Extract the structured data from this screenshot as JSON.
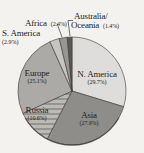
{
  "background": "#f3f2ef",
  "chart_data": {
    "type": "pie",
    "title": "",
    "legend_position": "none",
    "direction": "clockwise",
    "start_angle_deg": 0,
    "total": 100,
    "geometry": {
      "cx": 72,
      "cy": 91,
      "r": 54
    },
    "outline_color": "#3a3734",
    "slices": [
      {
        "name": "N. America",
        "value": 29.7,
        "pct_label": "(29.7%)",
        "color": "#dedddb",
        "label_placement": "inside"
      },
      {
        "name": "Asia",
        "value": 27.9,
        "pct_label": "(27.9%)",
        "color": "#8f8d8a",
        "label_placement": "inside"
      },
      {
        "name": "Russia",
        "value": 10.6,
        "pct_label": "(10.6%)",
        "color": "pattern:stripes",
        "label_placement": "inside"
      },
      {
        "name": "Europe",
        "value": 25.1,
        "pct_label": "(25.1%)",
        "color": "#abaaa7",
        "label_placement": "inside"
      },
      {
        "name": "S. America",
        "value": 2.9,
        "pct_label": "(2.9%)",
        "color": "#c6c5c2",
        "label_placement": "outside"
      },
      {
        "name": "Africa",
        "value": 2.4,
        "pct_label": "(2.4%)",
        "color": "#989693",
        "label_placement": "outside"
      },
      {
        "name": "Australia/Oceania",
        "value": 1.4,
        "pct_label": "(1.4%)",
        "color": "#5b5956",
        "label_placement": "outside"
      }
    ],
    "pattern_stripes": {
      "light": "#bcbab7",
      "dark": "#969491"
    }
  },
  "display": {
    "australia_line1": "Australia/",
    "australia_line2": "Oceania"
  }
}
